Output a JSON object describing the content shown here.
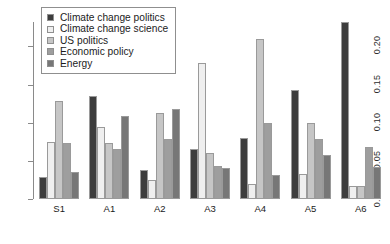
{
  "chart_data": {
    "type": "bar",
    "title": "",
    "subtitle": "",
    "xlabel": "",
    "ylabel": "",
    "grid": false,
    "legend_position": "top-left",
    "categories": [
      "S1",
      "A1",
      "A2",
      "A3",
      "A4",
      "A5",
      "A6"
    ],
    "ylim": [
      0.0,
      0.245
    ],
    "yticks": [
      0.0,
      0.05,
      0.1,
      0.15,
      0.2
    ],
    "ytick_labels": [
      "0.00",
      "0.05",
      "0.10",
      "0.15",
      "0.20"
    ],
    "series": [
      {
        "name": "Climate change politics",
        "color": "#3d3d3d",
        "values": [
          0.029,
          0.135,
          0.038,
          0.065,
          0.08,
          0.143,
          0.232
        ]
      },
      {
        "name": "Climate change science",
        "color": "#efefef",
        "values": [
          0.075,
          0.094,
          0.025,
          0.178,
          0.02,
          0.033,
          0.017
        ]
      },
      {
        "name": "US politics",
        "color": "#c6c6c6",
        "values": [
          0.128,
          0.073,
          0.113,
          0.06,
          0.21,
          0.1,
          0.017
        ]
      },
      {
        "name": "Economic policy",
        "color": "#9e9e9e",
        "values": [
          0.073,
          0.065,
          0.078,
          0.043,
          0.1,
          0.078,
          0.068
        ]
      },
      {
        "name": "Energy",
        "color": "#777777",
        "values": [
          0.036,
          0.109,
          0.118,
          0.04,
          0.032,
          0.058,
          0.042
        ]
      }
    ]
  },
  "legend": {
    "entries": [
      {
        "label": "Climate change politics"
      },
      {
        "label": "Climate change science"
      },
      {
        "label": "US politics"
      },
      {
        "label": "Economic policy"
      },
      {
        "label": "Energy"
      }
    ]
  }
}
